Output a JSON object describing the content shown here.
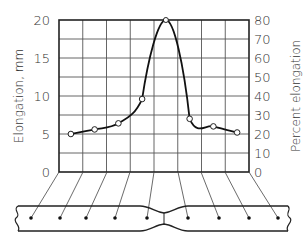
{
  "chart_data": {
    "type": "line",
    "title": "",
    "xlabel": "",
    "ylabel": "Elongation, mm",
    "ylabel_right": "Percent elongation",
    "ylim": [
      0,
      20
    ],
    "ylim_right": [
      0,
      80
    ],
    "y_ticks": [
      "0",
      "5",
      "10",
      "15",
      "20"
    ],
    "y_ticks_right": [
      "0",
      "10",
      "20",
      "30",
      "40",
      "50",
      "60",
      "70",
      "80"
    ],
    "grid": true,
    "x_segments": [
      1,
      2,
      3,
      4,
      5,
      6,
      7,
      8
    ],
    "series": [
      {
        "name": "Elongation per gage segment",
        "x": [
          1,
          2,
          3,
          4,
          5,
          6,
          7,
          8
        ],
        "values": [
          5.0,
          5.6,
          6.4,
          9.6,
          20.0,
          7.0,
          6.0,
          5.2
        ],
        "percent": [
          20,
          22,
          26,
          38,
          80,
          28,
          24,
          21
        ]
      }
    ],
    "annotation": "Necked tensile specimen with gage marks below the chart"
  },
  "labels": {
    "y_left": "Elongation, mm",
    "y_right": "Percent elongation"
  }
}
